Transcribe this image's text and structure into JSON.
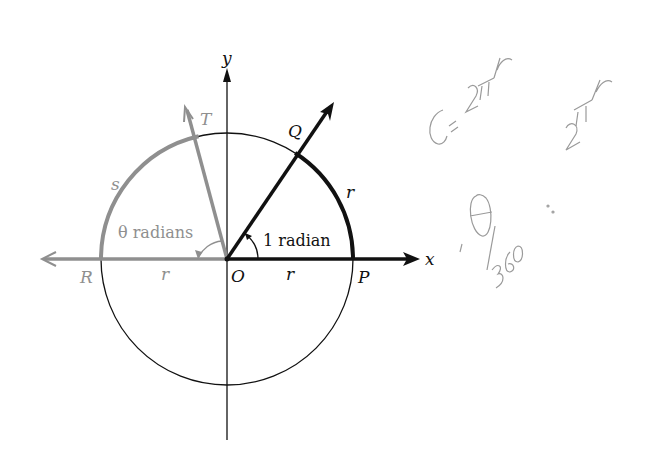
{
  "diagram": {
    "colors": {
      "black": "#111111",
      "gray": "#8f8f8f",
      "handwriting": "#9a9a9a"
    },
    "labels": {
      "y_axis": "y",
      "x_axis": "x",
      "origin": "O",
      "point_P": "P",
      "point_Q": "Q",
      "point_R": "R",
      "point_T": "T",
      "arc_s": "s",
      "arc_r": "r",
      "radius_right": "r",
      "radius_left": "r",
      "angle_one": "1 radian",
      "angle_theta": "θ radians"
    },
    "handwritten_notes": [
      "C = 2πr",
      "θ/360 = ·· 2πr"
    ]
  }
}
